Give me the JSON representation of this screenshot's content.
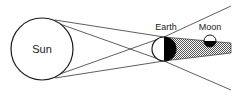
{
  "diagram": {
    "type": "lunar-eclipse",
    "labels": {
      "sun": "Sun",
      "earth": "Earth",
      "moon": "Moon"
    },
    "colors": {
      "stroke": "#1a1a1a",
      "background": "#ffffff",
      "shadow_fill": "#9a9a9a",
      "night_side": "#000000"
    }
  }
}
